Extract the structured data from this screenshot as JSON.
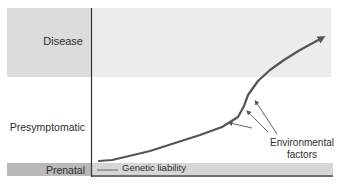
{
  "diagram": {
    "title": "",
    "stages": [
      {
        "id": "disease",
        "label": "Disease"
      },
      {
        "id": "presymptomatic",
        "label": "Presymptomatic"
      },
      {
        "id": "prenatal",
        "label": "Prenatal"
      }
    ],
    "curve_label": "Genetic liability",
    "annotation": "Environmental factors",
    "annotation_lines": [
      "Environmental",
      "factors"
    ],
    "colors": {
      "curve": "#555555",
      "disease_band_left": "#dcdcdc",
      "disease_band_right": "#ececec",
      "prenatal_band_left": "#b9b9b9",
      "prenatal_band_right": "#d6d6d6",
      "axis": "#333333"
    }
  }
}
